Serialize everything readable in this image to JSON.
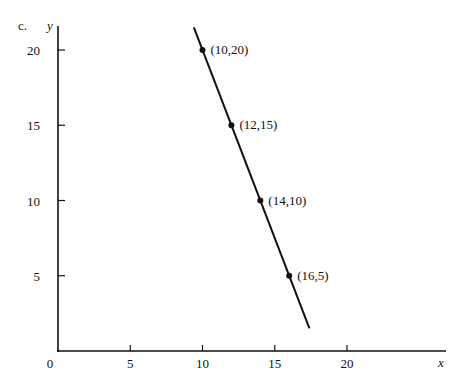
{
  "figure_label": "c.",
  "chart_data": {
    "type": "line",
    "title": "",
    "xlabel": "x",
    "ylabel": "y",
    "xlim": [
      0,
      23
    ],
    "ylim": [
      0,
      22
    ],
    "x_ticks": [
      0,
      5,
      10,
      15,
      20
    ],
    "y_ticks": [
      5,
      10,
      15,
      20
    ],
    "x_tick_labels": [
      "0",
      "5",
      "10",
      "15",
      "20"
    ],
    "y_tick_labels": [
      "5",
      "10",
      "15",
      "20"
    ],
    "grid": false,
    "legend": null,
    "series": [
      {
        "name": "line",
        "points": [
          {
            "x": 10,
            "y": 20,
            "label": "(10,20)"
          },
          {
            "x": 12,
            "y": 15,
            "label": "(12,15)"
          },
          {
            "x": 14,
            "y": 10,
            "label": "(14,10)"
          },
          {
            "x": 16,
            "y": 5,
            "label": "(16,5)"
          }
        ],
        "line_extent": {
          "x_start": 9.4,
          "y_start": 21.5,
          "x_end": 17.4,
          "y_end": 1.5
        },
        "color": "#111111"
      }
    ]
  }
}
